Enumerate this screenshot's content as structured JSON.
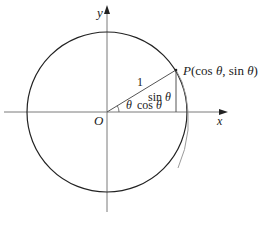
{
  "figure": {
    "type": "unit-circle",
    "axes": {
      "x_label": "x",
      "y_label": "y",
      "origin_label": "O"
    },
    "point": {
      "name": "P",
      "coords_text": "(cos θ, sin θ)",
      "label_prefix": "P",
      "label_open": "(cos ",
      "label_theta1": "θ",
      "label_mid": ", sin ",
      "label_theta2": "θ",
      "label_close": ")"
    },
    "segments": {
      "radius_label": "1",
      "opposite_label_fn": "sin ",
      "opposite_label_var": "θ",
      "adjacent_label_fn": "cos ",
      "adjacent_label_var": "θ",
      "angle_label": "θ"
    },
    "colors": {
      "circle": "#222222",
      "axes": "#777777",
      "arc": "#999999",
      "text": "#222222"
    }
  }
}
